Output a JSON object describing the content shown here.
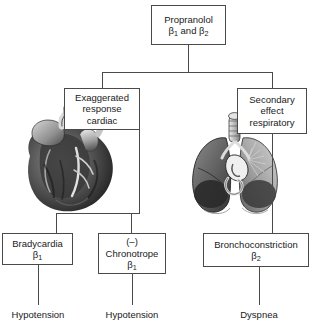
{
  "diagram": {
    "line_color": "#4a4a4a",
    "text_color": "#1a1a1a",
    "background": "#ffffff"
  },
  "nodes": {
    "root": {
      "line1": "Propranolol",
      "line2_pre": "β",
      "line2_sub1": "1",
      "line2_mid": " and β",
      "line2_sub2": "2"
    },
    "cardiac": {
      "line1": "Exaggerated",
      "line2": "response",
      "line3": "cardiac"
    },
    "respiratory": {
      "line1": "Secondary",
      "line2": "effect",
      "line3": "respiratory"
    },
    "bradycardia": {
      "line1": "Bradycardia",
      "line2_pre": "β",
      "line2_sub": "1"
    },
    "chronotrope": {
      "line1": "(–)",
      "line2": "Chronotrope",
      "line3_pre": "β",
      "line3_sub": "1"
    },
    "bronchoconstriction": {
      "line1": "Bronchoconstriction",
      "line2_pre": "β",
      "line2_sub": "2"
    }
  },
  "outcomes": {
    "left": "Hypotension",
    "middle": "Hypotension",
    "right": "Dyspnea"
  },
  "illustrations": {
    "heart": "anatomical-heart-illustration",
    "lungs": "anatomical-lungs-illustration"
  }
}
